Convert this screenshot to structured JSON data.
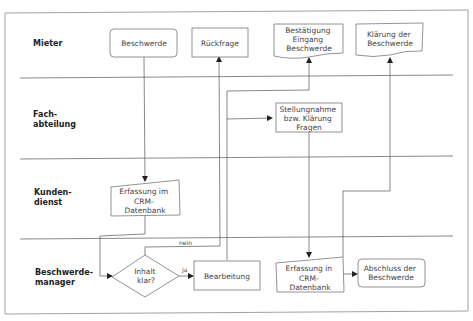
{
  "lanes": [
    {
      "label_lines": [
        "Mieter"
      ]
    },
    {
      "label_lines": [
        "Fach-",
        "abteilung"
      ]
    },
    {
      "label_lines": [
        "Kunden-",
        "dienst"
      ]
    },
    {
      "label_lines": [
        "Beschwerde-",
        "manager"
      ]
    }
  ],
  "nodes": {
    "beschwerde": {
      "lines": [
        "Beschwerde"
      ],
      "shape": "rounded-rectangle"
    },
    "rueckfrage": {
      "lines": [
        "Rückfrage"
      ],
      "shape": "rectangle"
    },
    "bestaetigung": {
      "lines": [
        "Bestätigung",
        "Eingang",
        "Beschwerde"
      ],
      "shape": "document"
    },
    "klaerung": {
      "lines": [
        "Klärung der",
        "Beschwerde"
      ],
      "shape": "document"
    },
    "stellungnahme": {
      "lines": [
        "Stellungnahme",
        "bzw. Klärung",
        "Fragen"
      ],
      "shape": "rectangle"
    },
    "erfassung_kd": {
      "lines": [
        "Erfassung im",
        "CRM-",
        "Datenbank"
      ],
      "shape": "manual-input"
    },
    "inhalt_klar": {
      "lines": [
        "Inhalt",
        "klar?"
      ],
      "shape": "decision"
    },
    "bearbeitung": {
      "lines": [
        "Bearbeitung"
      ],
      "shape": "rectangle"
    },
    "erfassung_bm": {
      "lines": [
        "Erfassung in",
        "CRM-",
        "Datenbank"
      ],
      "shape": "manual-input"
    },
    "abschluss": {
      "lines": [
        "Abschluss der",
        "Beschwerde"
      ],
      "shape": "rounded-rectangle"
    }
  },
  "edge_labels": {
    "yes": "ja",
    "no": "nein"
  },
  "colors": {
    "line": "#555555",
    "shape_stroke": "#777777",
    "text": "#444444"
  }
}
